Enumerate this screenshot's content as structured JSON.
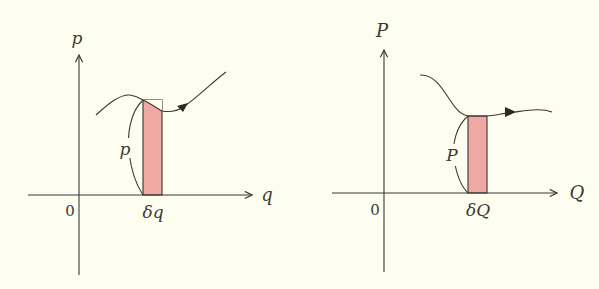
{
  "colors": {
    "background": "#fdfdf0",
    "ink": "#3a3a36",
    "strip_fill": "#f0a8a4"
  },
  "panels": [
    {
      "name": "original-coordinates",
      "vertical_axis_label": "p",
      "horizontal_axis_label": "q",
      "origin_label": "0",
      "strip_label": "δq",
      "height_label": "p"
    },
    {
      "name": "transformed-coordinates",
      "vertical_axis_label": "P",
      "horizontal_axis_label": "Q",
      "origin_label": "0",
      "strip_label": "δQ",
      "height_label": "P"
    }
  ]
}
